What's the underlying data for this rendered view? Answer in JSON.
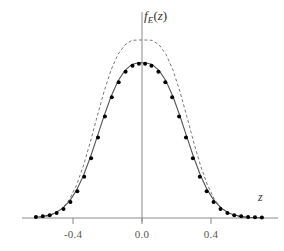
{
  "chart_data": {
    "type": "line",
    "title": "",
    "subtitle": "",
    "xlabel": "z",
    "ylabel_parts": {
      "f": "f",
      "sub": "E",
      "open": "(",
      "z": "z",
      "close": ")"
    },
    "ylabel": "f_E(z)",
    "xlim": [
      -0.62,
      0.72
    ],
    "ylim": [
      0,
      1.22
    ],
    "xticks": [
      -0.4,
      0.0,
      0.4
    ],
    "xticklabels": [
      "-0.4",
      "0.0",
      "0.4"
    ],
    "yticks": [],
    "yticklabels": [],
    "grid": false,
    "legend": null,
    "axis_color": "#888888",
    "curve_color": "#555555",
    "marker_color": "#000000",
    "series": [
      {
        "name": "solid-curve",
        "style": "solid",
        "color": "#555555",
        "x": [
          -0.62,
          -0.58,
          -0.54,
          -0.5,
          -0.46,
          -0.42,
          -0.38,
          -0.34,
          -0.3,
          -0.26,
          -0.22,
          -0.18,
          -0.14,
          -0.1,
          -0.06,
          -0.02,
          0.02,
          0.06,
          0.1,
          0.14,
          0.18,
          0.22,
          0.26,
          0.3,
          0.34,
          0.38,
          0.42,
          0.46,
          0.5,
          0.54,
          0.58,
          0.62,
          0.66,
          0.7
        ],
        "y": [
          0.004,
          0.008,
          0.016,
          0.03,
          0.055,
          0.095,
          0.155,
          0.237,
          0.34,
          0.456,
          0.573,
          0.681,
          0.768,
          0.828,
          0.862,
          0.872,
          0.872,
          0.862,
          0.828,
          0.768,
          0.681,
          0.573,
          0.456,
          0.34,
          0.237,
          0.155,
          0.095,
          0.055,
          0.03,
          0.016,
          0.008,
          0.004,
          0.002,
          0.001
        ]
      },
      {
        "name": "dashed-curve",
        "style": "dashed",
        "color": "#777777",
        "x": [
          -0.62,
          -0.58,
          -0.54,
          -0.5,
          -0.46,
          -0.42,
          -0.38,
          -0.34,
          -0.3,
          -0.26,
          -0.22,
          -0.18,
          -0.14,
          -0.1,
          -0.06,
          -0.02,
          0.02,
          0.06,
          0.1,
          0.14,
          0.18,
          0.22,
          0.26,
          0.3,
          0.34,
          0.38,
          0.42,
          0.46,
          0.5,
          0.54,
          0.58,
          0.62,
          0.66,
          0.7
        ],
        "y": [
          0.002,
          0.005,
          0.012,
          0.027,
          0.056,
          0.106,
          0.184,
          0.292,
          0.425,
          0.57,
          0.71,
          0.83,
          0.918,
          0.972,
          0.998,
          1.0,
          1.0,
          0.998,
          0.972,
          0.918,
          0.83,
          0.71,
          0.57,
          0.425,
          0.292,
          0.184,
          0.106,
          0.056,
          0.027,
          0.012,
          0.005,
          0.002,
          0.001,
          0.0
        ]
      }
    ],
    "markers": {
      "name": "data-points",
      "shape": "filled-circle",
      "color": "#000000",
      "size": 4,
      "x": [
        -0.615,
        -0.575,
        -0.535,
        -0.495,
        -0.455,
        -0.415,
        -0.375,
        -0.335,
        -0.295,
        -0.255,
        -0.215,
        -0.175,
        -0.135,
        -0.095,
        -0.055,
        -0.018,
        0.018,
        0.055,
        0.095,
        0.135,
        0.175,
        0.215,
        0.255,
        0.295,
        0.335,
        0.375,
        0.415,
        0.455,
        0.495,
        0.535,
        0.575,
        0.615,
        0.655,
        0.695
      ],
      "y": [
        0.006,
        0.01,
        0.016,
        0.028,
        0.05,
        0.09,
        0.15,
        0.232,
        0.336,
        0.452,
        0.57,
        0.678,
        0.762,
        0.822,
        0.856,
        0.866,
        0.866,
        0.856,
        0.822,
        0.762,
        0.678,
        0.57,
        0.452,
        0.336,
        0.232,
        0.15,
        0.09,
        0.05,
        0.028,
        0.016,
        0.01,
        0.006,
        0.004,
        0.003
      ]
    }
  },
  "axes": {
    "x_axis_label": "z",
    "y_axis_label": "f_E(z)",
    "tick_labels": [
      "-0.4",
      "0.0",
      "0.4"
    ]
  }
}
